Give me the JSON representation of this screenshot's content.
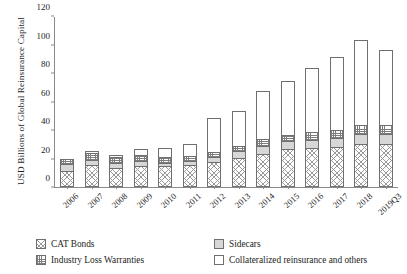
{
  "chart_data": {
    "type": "bar",
    "subtype": "stacked",
    "title": "",
    "xlabel": "",
    "ylabel": "USD Billions of Global Reinsurance Capital",
    "ylim": [
      0,
      120
    ],
    "yticks": [
      0,
      20,
      40,
      60,
      80,
      100,
      120
    ],
    "grid": false,
    "legend_position": "bottom",
    "categories": [
      "2006",
      "2007",
      "2008",
      "2009",
      "2010",
      "2011",
      "2012",
      "2013",
      "2014",
      "2015",
      "2016",
      "2017",
      "2018",
      "2019Q3"
    ],
    "series": [
      {
        "name": "CAT Bonds",
        "pattern": "diagonal-crosshatch",
        "color": "#9a9a9a",
        "values": [
          10,
          14,
          12,
          13,
          13,
          14,
          16,
          19,
          22,
          25,
          26,
          27,
          29,
          29
        ]
      },
      {
        "name": "Sidecars",
        "pattern": "solid-gray",
        "color": "#d7d7d7",
        "values": [
          4,
          3,
          3,
          3,
          2,
          2,
          3,
          4,
          5,
          5,
          5,
          5,
          6,
          6
        ]
      },
      {
        "name": "Industry Loss Warranties",
        "pattern": "grid-crosshatch",
        "color": "#7d7d7d",
        "values": [
          3,
          4,
          3,
          4,
          3,
          3,
          3,
          3,
          4,
          4,
          5,
          5,
          6,
          6
        ]
      },
      {
        "name": "Collateralized reinsurance and others",
        "pattern": "white",
        "color": "#ffffff",
        "values": [
          0,
          1,
          1,
          3,
          6,
          8,
          23,
          24,
          33,
          37,
          44,
          51,
          59,
          52
        ]
      }
    ],
    "totals": [
      17,
      22,
      19,
      23,
      24,
      27,
      45,
      50,
      64,
      71,
      80,
      88,
      100,
      93
    ]
  },
  "legend": {
    "items": [
      {
        "label": "CAT Bonds",
        "swatch": "swatch-cat-bonds"
      },
      {
        "label": "Sidecars",
        "swatch": "swatch-sidecars"
      },
      {
        "label": "Industry Loss Warranties",
        "swatch": "swatch-ilw"
      },
      {
        "label": "Collateralized reinsurance and others",
        "swatch": "swatch-collateralized"
      }
    ]
  }
}
